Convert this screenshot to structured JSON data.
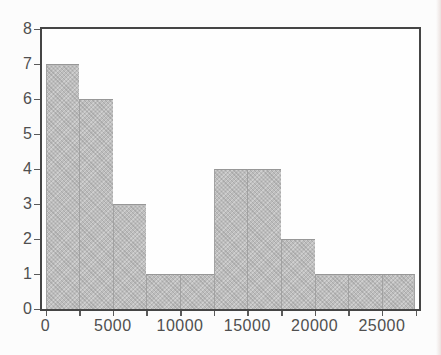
{
  "chart_data": {
    "type": "bar",
    "subtype": "histogram",
    "title": "",
    "xlabel": "",
    "ylabel": "",
    "bin_width": 2500,
    "bin_edges": [
      0,
      2500,
      5000,
      7500,
      10000,
      12500,
      15000,
      17500,
      20000,
      22500,
      25000,
      27500
    ],
    "counts": [
      7,
      6,
      3,
      1,
      1,
      4,
      4,
      2,
      1,
      1,
      1
    ],
    "x_tick_values": [
      0,
      5000,
      10000,
      15000,
      20000,
      25000
    ],
    "x_tick_labels": [
      "0",
      "5000",
      "10000",
      "15000",
      "20000",
      "25000"
    ],
    "x_minor_tick_interval": 2500,
    "x_minor_tick_max": 27500,
    "y_tick_values": [
      0,
      1,
      2,
      3,
      4,
      5,
      6,
      7,
      8
    ],
    "y_tick_labels": [
      "0",
      "1",
      "2",
      "3",
      "4",
      "5",
      "6",
      "7",
      "8"
    ],
    "ylim": [
      0,
      8
    ],
    "xlim": [
      0,
      27500
    ],
    "grid": false,
    "legend": null,
    "colors": {
      "bar_fill": "#bdbdbd",
      "bar_edge": "#9a9a9a",
      "plot_border": "#454545",
      "tick_color": "#5a5a5a",
      "label_color": "#4f4f4f",
      "background": "#fcfcfc"
    }
  }
}
